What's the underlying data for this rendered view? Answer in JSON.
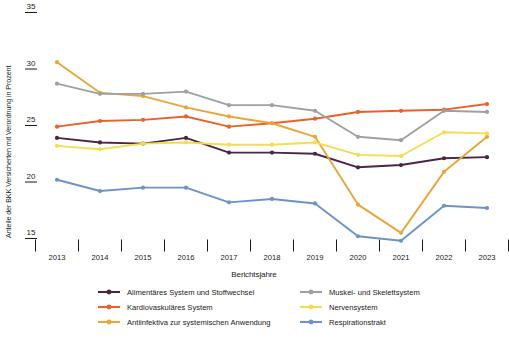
{
  "chart_data": {
    "type": "line",
    "title": "",
    "xlabel": "Berichtsjahre",
    "ylabel": "Anteile der BKK Versicherten mit Verordnung in Prozent",
    "categories": [
      "2013",
      "2014",
      "2015",
      "2016",
      "2017",
      "2018",
      "2019",
      "2020",
      "2021",
      "2022",
      "2023"
    ],
    "x": [
      2013,
      2014,
      2015,
      2016,
      2017,
      2018,
      2019,
      2020,
      2021,
      2022,
      2023
    ],
    "ylim": [
      13.5,
      35.5
    ],
    "yticks": [
      15,
      20,
      25,
      30,
      35
    ],
    "ytick_labels": [
      "15",
      "20",
      "25",
      "30",
      "35"
    ],
    "grid": false,
    "legend_position": "bottom",
    "series": [
      {
        "name": "Alimentäres System und Stoffwechsel",
        "color": "#4B2545",
        "values": [
          23.9,
          23.5,
          23.4,
          23.9,
          22.6,
          22.6,
          22.5,
          21.3,
          21.5,
          22.1,
          22.2
        ]
      },
      {
        "name": "Kardiovaskuläres System",
        "color": "#E8622A",
        "values": [
          24.9,
          25.4,
          25.5,
          25.8,
          24.9,
          25.2,
          25.6,
          26.2,
          26.3,
          26.4,
          26.9
        ]
      },
      {
        "name": "Antiinfektiva zur systemischen Anwendung",
        "color": "#E9A63A",
        "values": [
          30.6,
          27.9,
          27.6,
          26.6,
          25.8,
          25.2,
          24.0,
          18.0,
          15.5,
          20.9,
          24.0
        ]
      },
      {
        "name": "Muskel- und Skelettsystem",
        "color": "#9DA1A5",
        "values": [
          28.7,
          27.8,
          27.8,
          28.0,
          26.8,
          26.8,
          26.3,
          24.0,
          23.7,
          26.3,
          26.2
        ]
      },
      {
        "name": "Nervensystem",
        "color": "#F5DC50",
        "values": [
          23.2,
          22.9,
          23.4,
          23.5,
          23.3,
          23.3,
          23.5,
          22.4,
          22.3,
          24.4,
          24.3
        ]
      },
      {
        "name": "Respirationstrakt",
        "color": "#6D93C8",
        "values": [
          20.2,
          19.2,
          19.5,
          19.5,
          18.2,
          18.5,
          18.1,
          15.2,
          14.8,
          17.9,
          17.7
        ]
      }
    ]
  },
  "legend": {
    "items": [
      {
        "label": "Alimentäres System und Stoffwechsel",
        "color": "#4B2545"
      },
      {
        "label": "Muskel- und Skelettsystem",
        "color": "#9DA1A5"
      },
      {
        "label": "Kardiovaskuläres System",
        "color": "#E8622A"
      },
      {
        "label": "Nervensystem",
        "color": "#F5DC50"
      },
      {
        "label": "Antiinfektiva zur systemischen Anwendung",
        "color": "#E9A63A"
      },
      {
        "label": "Respirationstrakt",
        "color": "#6D93C8"
      }
    ]
  }
}
